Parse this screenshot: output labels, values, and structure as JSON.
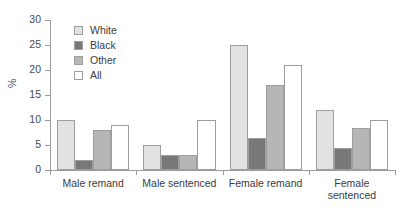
{
  "chart_data": {
    "type": "bar",
    "title": "",
    "subtitle": "",
    "xlabel": "",
    "ylabel": "%",
    "ylim": [
      0,
      30
    ],
    "yticks": [
      0,
      5,
      10,
      15,
      20,
      25,
      30
    ],
    "ytick_labels": [
      "0",
      "5",
      "10",
      "15",
      "20",
      "25",
      "30"
    ],
    "grid": false,
    "legend_position": "top-left inside plot",
    "categories": [
      "Male remand",
      "Male sentenced",
      "Female remand",
      "Female sentenced"
    ],
    "series": [
      {
        "name": "White",
        "color": "#e2e2e2",
        "values": [
          10,
          5,
          25,
          12
        ]
      },
      {
        "name": "Black",
        "color": "#787878",
        "values": [
          2,
          3,
          6.5,
          4.5
        ]
      },
      {
        "name": "Other",
        "color": "#b6b6b6",
        "values": [
          8,
          3,
          17,
          8.5
        ]
      },
      {
        "name": "All",
        "color": "#ffffff",
        "values": [
          9,
          10,
          21,
          10
        ]
      }
    ]
  },
  "axis": {
    "y_label": "%"
  },
  "legend": {
    "items": [
      {
        "label": "White"
      },
      {
        "label": "Black"
      },
      {
        "label": "Other"
      },
      {
        "label": "All"
      }
    ]
  }
}
